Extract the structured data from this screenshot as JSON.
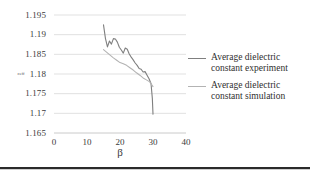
{
  "chart_data": {
    "type": "line",
    "title": "",
    "xlabel": "β",
    "ylabel": "εeff",
    "xlim": [
      0,
      40
    ],
    "ylim": [
      1.165,
      1.195
    ],
    "xticks": [
      "0",
      "10",
      "20",
      "30",
      "40"
    ],
    "yticks": [
      "1.165",
      "1.17",
      "1.175",
      "1.18",
      "1.185",
      "1.19",
      "1.195"
    ],
    "grid": "horizontal",
    "legend_position": "right",
    "series": [
      {
        "name": "Average dielectric constant experiment",
        "color": "#7f7f7f",
        "x": [
          15.0,
          15.6,
          16.2,
          16.8,
          17.4,
          18.0,
          18.6,
          19.2,
          19.8,
          20.4,
          21.0,
          21.6,
          22.2,
          22.8,
          23.4,
          24.0,
          24.6,
          25.2,
          25.8,
          26.4,
          27.0,
          27.6,
          28.2,
          28.8,
          29.4,
          29.8,
          30.0
        ],
        "y": [
          1.1925,
          1.189,
          1.1869,
          1.1884,
          1.1876,
          1.189,
          1.1889,
          1.1881,
          1.1868,
          1.1861,
          1.1853,
          1.1866,
          1.1863,
          1.1851,
          1.1843,
          1.1836,
          1.1828,
          1.1822,
          1.1814,
          1.1812,
          1.1805,
          1.1806,
          1.1797,
          1.1788,
          1.1776,
          1.1738,
          1.1698
        ]
      },
      {
        "name": "Average dielectric constant simulation",
        "color": "#b3b3b3",
        "x": [
          15.0,
          16.0,
          17.0,
          18.0,
          19.0,
          20.0,
          21.0,
          22.0,
          23.0,
          24.0,
          25.0,
          26.0,
          27.0,
          28.0,
          29.0,
          30.0
        ],
        "y": [
          1.1862,
          1.1855,
          1.1848,
          1.1841,
          1.1835,
          1.1829,
          1.1826,
          1.1822,
          1.1816,
          1.181,
          1.1803,
          1.1797,
          1.179,
          1.1785,
          1.178,
          1.1768
        ]
      }
    ]
  },
  "legend": {
    "items": [
      {
        "label_line1": "Average dielectric",
        "label_line2": "constant experiment"
      },
      {
        "label_line1": "Average dielectric",
        "label_line2": "constant simulation"
      }
    ]
  }
}
